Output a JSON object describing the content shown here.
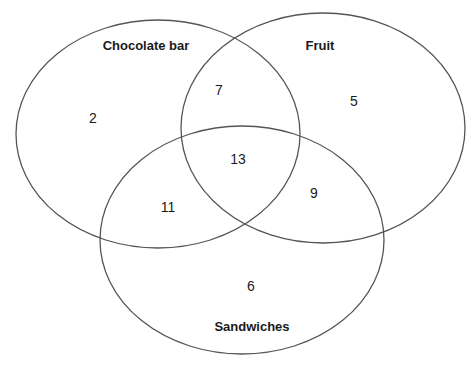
{
  "diagram": {
    "type": "venn",
    "sets": [
      {
        "name": "Chocolate bar"
      },
      {
        "name": "Fruit"
      },
      {
        "name": "Sandwiches"
      }
    ],
    "regions": {
      "chocolate_only": "2",
      "fruit_only": "5",
      "sandwiches_only": "6",
      "chocolate_fruit": "7",
      "chocolate_sandwiches": "11",
      "fruit_sandwiches": "9",
      "all_three": "13"
    },
    "stroke_color": "#555555"
  }
}
